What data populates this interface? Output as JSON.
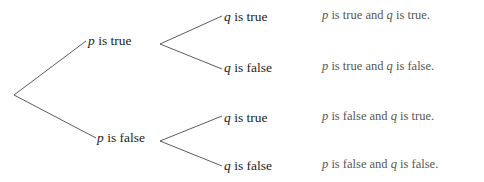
{
  "diagram": {
    "type": "binary-truth-tree",
    "title": "",
    "line_color": "#4a4a4a",
    "node_text_color": "#1d1d1d",
    "outcome_text_color": "#575757",
    "background": "#ffffff",
    "root": {
      "x": 14,
      "y": 95,
      "label": ""
    },
    "level1": [
      {
        "id": "p-true",
        "prefix": "p",
        "suffix": " is true",
        "vertex_x": 158,
        "vertex_y": 44,
        "label_right": 156
      },
      {
        "id": "p-false",
        "prefix": "p",
        "suffix": " is false",
        "vertex_x": 158,
        "vertex_y": 141,
        "label_right": 157
      }
    ],
    "level2": [
      {
        "id": "p-true-q-true",
        "parent": "p-true",
        "prefix": "q",
        "suffix": " is true",
        "x": 224,
        "y": 17
      },
      {
        "id": "p-true-q-false",
        "parent": "p-true",
        "prefix": "q",
        "suffix": " is false",
        "x": 224,
        "y": 68
      },
      {
        "id": "p-false-q-true",
        "parent": "p-false",
        "prefix": "q",
        "suffix": " is true",
        "x": 224,
        "y": 118
      },
      {
        "id": "p-false-q-false",
        "parent": "p-false",
        "prefix": "q",
        "suffix": " is false",
        "x": 224,
        "y": 166
      }
    ],
    "outcomes": [
      {
        "id": "outcome-tt",
        "p_var": "p",
        "p_text": " is true and ",
        "q_var": "q",
        "q_text": " is true.",
        "x": 322,
        "y": 15
      },
      {
        "id": "outcome-tf",
        "p_var": "p",
        "p_text": " is true and ",
        "q_var": "q",
        "q_text": " is false.",
        "x": 322,
        "y": 66
      },
      {
        "id": "outcome-ft",
        "p_var": "p",
        "p_text": " is false and ",
        "q_var": "q",
        "q_text": " is true.",
        "x": 322,
        "y": 116
      },
      {
        "id": "outcome-ff",
        "p_var": "p",
        "p_text": " is false and ",
        "q_var": "q",
        "q_text": " is false.",
        "x": 322,
        "y": 164
      }
    ],
    "edges": [
      {
        "id": "edge-root-ptrue",
        "x1": 14,
        "y1": 95,
        "x2": 86,
        "y2": 41
      },
      {
        "id": "edge-root-pfalse",
        "x1": 14,
        "y1": 95,
        "x2": 96,
        "y2": 138
      },
      {
        "id": "edge-ptrue-qtrue",
        "x1": 160,
        "y1": 44,
        "x2": 222,
        "y2": 16
      },
      {
        "id": "edge-ptrue-qfalse",
        "x1": 160,
        "y1": 44,
        "x2": 222,
        "y2": 69
      },
      {
        "id": "edge-pfalse-qtrue",
        "x1": 160,
        "y1": 141,
        "x2": 222,
        "y2": 116
      },
      {
        "id": "edge-pfalse-qfalse",
        "x1": 160,
        "y1": 141,
        "x2": 222,
        "y2": 166
      }
    ]
  }
}
